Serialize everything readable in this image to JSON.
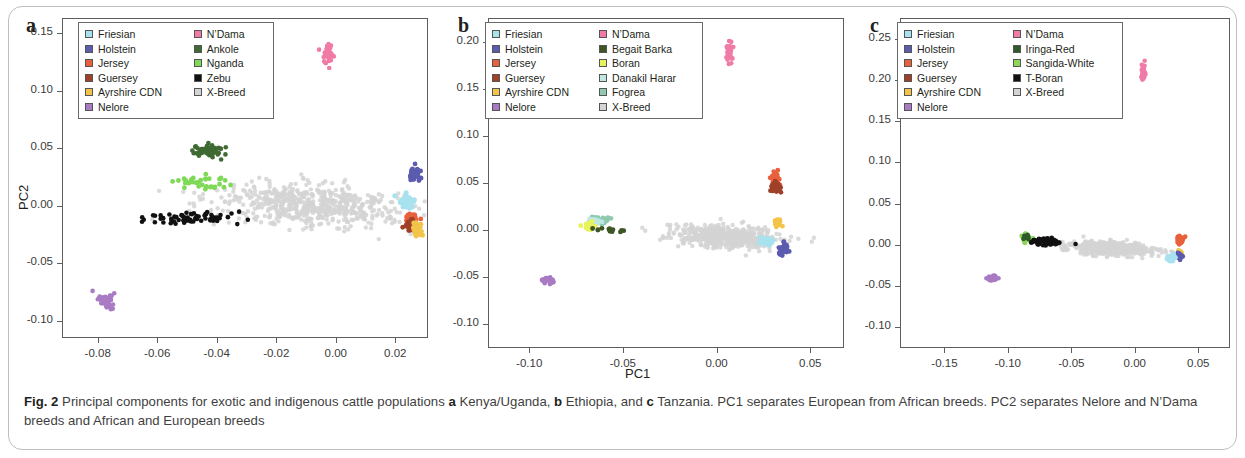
{
  "figure": {
    "caption_label": "Fig. 2",
    "caption_part1": " Principal components for exotic and indigenous cattle populations ",
    "caption_a": "a",
    "caption_part2": " Kenya/Uganda, ",
    "caption_b": "b",
    "caption_part3": " Ethiopia, and ",
    "caption_c": "c",
    "caption_part4": " Tanzania. PC1 separates European from African breeds. PC2 separates Nelore and N’Dama breeds and African and European breeds"
  },
  "axis_titles": {
    "y": "PC2",
    "x": "PC1"
  },
  "colors": {
    "friesian": "#a8e2ef",
    "holstein": "#5b5bb0",
    "jersey": "#e8613c",
    "guersey": "#9e4128",
    "ayrshire": "#f2c44a",
    "nelore": "#a97bc4",
    "ndama": "#ef7ba6",
    "ankole": "#3f6b33",
    "nganda": "#7ed957",
    "zebu": "#111111",
    "xbreed": "#d4d4d4",
    "begait_barka": "#3d5624",
    "boran": "#e8f25a",
    "danakil_harar": "#bfe8e4",
    "fogrea": "#8fc9ae",
    "iringa_red": "#2f5a2a",
    "sangida_white": "#8ed65a",
    "tboran": "#111111",
    "axis": "#5e5e5e"
  },
  "chart_data": [
    {
      "type": "scatter",
      "panel": "a",
      "title": "Kenya/Uganda",
      "xlabel": "",
      "ylabel": "PC2",
      "xlim": [
        -0.092,
        0.031
      ],
      "ylim": [
        -0.115,
        0.163
      ],
      "xticks": [
        -0.08,
        -0.06,
        -0.04,
        -0.02,
        0.0,
        0.02
      ],
      "xticklabels": [
        "-0.08",
        "-0.06",
        "-0.04",
        "-0.02",
        "0.00",
        "0.02"
      ],
      "yticks": [
        0.15,
        0.1,
        0.05,
        0.0,
        -0.05,
        -0.1
      ],
      "yticklabels": [
        "0.15",
        "0.10",
        "0.05",
        "0.00",
        "-0.05",
        "-0.10"
      ],
      "grid": false,
      "legend_position": "top-left-inside",
      "legend": [
        {
          "label": "Friesian",
          "color_key": "friesian"
        },
        {
          "label": "Holstein",
          "color_key": "holstein"
        },
        {
          "label": "Jersey",
          "color_key": "jersey"
        },
        {
          "label": "Guersey",
          "color_key": "guersey"
        },
        {
          "label": "Ayrshire CDN",
          "color_key": "ayrshire"
        },
        {
          "label": "Nelore",
          "color_key": "nelore"
        },
        {
          "label": "N’Dama",
          "color_key": "ndama"
        },
        {
          "label": "Ankole",
          "color_key": "ankole"
        },
        {
          "label": "Nganda",
          "color_key": "nganda"
        },
        {
          "label": "Zebu",
          "color_key": "zebu"
        },
        {
          "label": "X-Breed",
          "color_key": "xbreed"
        }
      ],
      "clusters": [
        {
          "name": "X-Breed",
          "color_key": "xbreed",
          "n": 620,
          "cx": -0.008,
          "cy": 0.002,
          "sx": 0.0155,
          "sy": 0.0088,
          "rot": -0.22,
          "r": 2.2
        },
        {
          "name": "Zebu",
          "color_key": "zebu",
          "n": 70,
          "cx": -0.049,
          "cy": -0.01,
          "sx": 0.0072,
          "sy": 0.0028,
          "rot": 0.05,
          "r": 2.3
        },
        {
          "name": "Ankole",
          "color_key": "ankole",
          "n": 62,
          "cx": -0.0435,
          "cy": 0.048,
          "sx": 0.0026,
          "sy": 0.0035,
          "rot": 0.0,
          "r": 2.3
        },
        {
          "name": "Nganda",
          "color_key": "nganda",
          "n": 34,
          "cx": -0.0455,
          "cy": 0.021,
          "sx": 0.004,
          "sy": 0.0032,
          "rot": 0.0,
          "r": 2.4
        },
        {
          "name": "Nelore",
          "color_key": "nelore",
          "n": 40,
          "cx": -0.0775,
          "cy": -0.0815,
          "sx": 0.0017,
          "sy": 0.0035,
          "rot": 0.3,
          "r": 2.3
        },
        {
          "name": "N’Dama",
          "color_key": "ndama",
          "n": 38,
          "cx": -0.003,
          "cy": 0.132,
          "sx": 0.0009,
          "sy": 0.0048,
          "rot": 0.0,
          "r": 2.3
        },
        {
          "name": "Holstein",
          "color_key": "holstein",
          "n": 34,
          "cx": 0.0263,
          "cy": 0.0268,
          "sx": 0.001,
          "sy": 0.0033,
          "rot": 0.0,
          "r": 2.4
        },
        {
          "name": "Friesian",
          "color_key": "friesian",
          "n": 36,
          "cx": 0.0228,
          "cy": 0.0045,
          "sx": 0.0015,
          "sy": 0.003,
          "rot": 0.0,
          "r": 2.5
        },
        {
          "name": "Jersey",
          "color_key": "jersey",
          "n": 30,
          "cx": 0.0252,
          "cy": -0.0105,
          "sx": 0.0011,
          "sy": 0.0022,
          "rot": 0.0,
          "r": 2.4
        },
        {
          "name": "Guersey",
          "color_key": "guersey",
          "n": 30,
          "cx": 0.025,
          "cy": -0.0165,
          "sx": 0.001,
          "sy": 0.003,
          "rot": 0.0,
          "r": 2.4
        },
        {
          "name": "Ayrshire CDN",
          "color_key": "ayrshire",
          "n": 28,
          "cx": 0.0268,
          "cy": -0.0205,
          "sx": 0.001,
          "sy": 0.003,
          "rot": 0.0,
          "r": 2.4
        }
      ]
    },
    {
      "type": "scatter",
      "panel": "b",
      "title": "Ethiopia",
      "xlabel": "PC1",
      "ylabel": "",
      "xlim": [
        -0.122,
        0.068
      ],
      "ylim": [
        -0.125,
        0.225
      ],
      "xticks": [
        -0.1,
        -0.05,
        0.0,
        0.05
      ],
      "xticklabels": [
        "-0.10",
        "-0.05",
        "0.00",
        "0.05"
      ],
      "yticks": [
        0.2,
        0.15,
        0.1,
        0.05,
        0.0,
        -0.05,
        -0.1
      ],
      "yticklabels": [
        "0.20",
        "0.15",
        "0.10",
        "0.05",
        "0.00",
        "-0.05",
        "-0.10"
      ],
      "grid": false,
      "legend_position": "top-left-inside",
      "legend": [
        {
          "label": "Friesian",
          "color_key": "friesian"
        },
        {
          "label": "Holstein",
          "color_key": "holstein"
        },
        {
          "label": "Jersey",
          "color_key": "jersey"
        },
        {
          "label": "Guersey",
          "color_key": "guersey"
        },
        {
          "label": "Ayrshire CDN",
          "color_key": "ayrshire"
        },
        {
          "label": "Nelore",
          "color_key": "nelore"
        },
        {
          "label": "N’Dama",
          "color_key": "ndama"
        },
        {
          "label": "Begait Barka",
          "color_key": "begait_barka"
        },
        {
          "label": "Boran",
          "color_key": "boran"
        },
        {
          "label": "Danakil Harar",
          "color_key": "danakil_harar"
        },
        {
          "label": "Fogrea",
          "color_key": "fogrea"
        },
        {
          "label": "X-Breed",
          "color_key": "xbreed"
        }
      ],
      "clusters": [
        {
          "name": "X-Breed",
          "color_key": "xbreed",
          "n": 560,
          "cx": 0.004,
          "cy": -0.006,
          "sx": 0.0135,
          "sy": 0.0058,
          "rot": -0.16,
          "r": 2.2
        },
        {
          "name": "Nelore",
          "color_key": "nelore",
          "n": 34,
          "cx": -0.0905,
          "cy": -0.052,
          "sx": 0.002,
          "sy": 0.0022,
          "rot": 0.3,
          "r": 2.3
        },
        {
          "name": "N’Dama",
          "color_key": "ndama",
          "n": 34,
          "cx": 0.0062,
          "cy": 0.1905,
          "sx": 0.0009,
          "sy": 0.0045,
          "rot": 0.0,
          "r": 2.3
        },
        {
          "name": "Jersey",
          "color_key": "jersey",
          "n": 34,
          "cx": 0.031,
          "cy": 0.056,
          "sx": 0.0011,
          "sy": 0.004,
          "rot": 0.0,
          "r": 2.4
        },
        {
          "name": "Guersey",
          "color_key": "guersey",
          "n": 26,
          "cx": 0.0312,
          "cy": 0.0455,
          "sx": 0.001,
          "sy": 0.0028,
          "rot": 0.0,
          "r": 2.4
        },
        {
          "name": "Ayrshire CDN",
          "color_key": "ayrshire",
          "n": 26,
          "cx": 0.0322,
          "cy": 0.0095,
          "sx": 0.0009,
          "sy": 0.0028,
          "rot": 0.0,
          "r": 2.4
        },
        {
          "name": "Friesian",
          "color_key": "friesian",
          "n": 34,
          "cx": 0.0253,
          "cy": -0.0105,
          "sx": 0.0017,
          "sy": 0.0022,
          "rot": 0.0,
          "r": 2.5
        },
        {
          "name": "Holstein",
          "color_key": "holstein",
          "n": 34,
          "cx": 0.0348,
          "cy": -0.0185,
          "sx": 0.0012,
          "sy": 0.003,
          "rot": 0.0,
          "r": 2.4
        },
        {
          "name": "Fogrea",
          "color_key": "fogrea",
          "n": 26,
          "cx": -0.063,
          "cy": 0.0115,
          "sx": 0.0022,
          "sy": 0.0018,
          "rot": 0.7,
          "r": 2.4
        },
        {
          "name": "Danakil Harar",
          "color_key": "danakil_harar",
          "n": 22,
          "cx": -0.0655,
          "cy": 0.0098,
          "sx": 0.002,
          "sy": 0.0016,
          "rot": 0.7,
          "r": 2.4
        },
        {
          "name": "Boran",
          "color_key": "boran",
          "n": 22,
          "cx": -0.0685,
          "cy": 0.006,
          "sx": 0.0019,
          "sy": 0.0015,
          "rot": 0.7,
          "r": 2.4
        },
        {
          "name": "Begait Barka",
          "color_key": "begait_barka",
          "n": 12,
          "cx": -0.0605,
          "cy": 0.0015,
          "sx": 0.0055,
          "sy": 0.0012,
          "rot": 0.0,
          "r": 2.4
        }
      ]
    },
    {
      "type": "scatter",
      "panel": "c",
      "title": "Tanzania",
      "xlabel": "",
      "ylabel": "",
      "xlim": [
        -0.185,
        0.075
      ],
      "ylim": [
        -0.125,
        0.275
      ],
      "xticks": [
        -0.15,
        -0.1,
        -0.05,
        0.0,
        0.05
      ],
      "xticklabels": [
        "-0.15",
        "-0.10",
        "-0.05",
        "0.00",
        "0.05"
      ],
      "yticks": [
        0.25,
        0.2,
        0.15,
        0.1,
        0.05,
        0.0,
        -0.05,
        -0.1
      ],
      "yticklabels": [
        "0.25",
        "0.20",
        "0.15",
        "0.10",
        "0.05",
        "0.00",
        "-0.05",
        "-0.10"
      ],
      "grid": false,
      "legend_position": "top-left-inside",
      "legend": [
        {
          "label": "Friesian",
          "color_key": "friesian"
        },
        {
          "label": "Holstein",
          "color_key": "holstein"
        },
        {
          "label": "Jersey",
          "color_key": "jersey"
        },
        {
          "label": "Guersey",
          "color_key": "guersey"
        },
        {
          "label": "Ayrshire CDN",
          "color_key": "ayrshire"
        },
        {
          "label": "Nelore",
          "color_key": "nelore"
        },
        {
          "label": "N’Dama",
          "color_key": "ndama"
        },
        {
          "label": "Iringa-Red",
          "color_key": "iringa_red"
        },
        {
          "label": "Sangida-White",
          "color_key": "sangida_white"
        },
        {
          "label": "T-Boran",
          "color_key": "tboran"
        },
        {
          "label": "X-Breed",
          "color_key": "xbreed"
        }
      ],
      "clusters": [
        {
          "name": "X-Breed",
          "color_key": "xbreed",
          "n": 460,
          "cx": -0.02,
          "cy": -0.003,
          "sx": 0.0165,
          "sy": 0.004,
          "rot": -0.1,
          "r": 2.2
        },
        {
          "name": "Nelore",
          "color_key": "nelore",
          "n": 30,
          "cx": -0.113,
          "cy": -0.0395,
          "sx": 0.0028,
          "sy": 0.0018,
          "rot": 0.35,
          "r": 2.3
        },
        {
          "name": "N’Dama",
          "color_key": "ndama",
          "n": 30,
          "cx": 0.006,
          "cy": 0.21,
          "sx": 0.0009,
          "sy": 0.0045,
          "rot": 0.0,
          "r": 2.3
        },
        {
          "name": "Sangida-White",
          "color_key": "sangida_white",
          "n": 34,
          "cx": -0.0855,
          "cy": 0.0085,
          "sx": 0.0026,
          "sy": 0.0022,
          "rot": 0.0,
          "r": 2.4
        },
        {
          "name": "Iringa-Red",
          "color_key": "iringa_red",
          "n": 10,
          "cx": -0.0845,
          "cy": 0.011,
          "sx": 0.0018,
          "sy": 0.0016,
          "rot": 0.0,
          "r": 2.4
        },
        {
          "name": "T-Boran",
          "color_key": "tboran",
          "n": 70,
          "cx": -0.07,
          "cy": 0.0048,
          "sx": 0.0075,
          "sy": 0.0022,
          "rot": 0.0,
          "r": 2.3
        },
        {
          "name": "Jersey",
          "color_key": "jersey",
          "n": 30,
          "cx": 0.0348,
          "cy": 0.0075,
          "sx": 0.0011,
          "sy": 0.0024,
          "rot": 0.0,
          "r": 2.4
        },
        {
          "name": "Ayrshire CDN",
          "color_key": "ayrshire",
          "n": 20,
          "cx": 0.0348,
          "cy": -0.0095,
          "sx": 0.0009,
          "sy": 0.0018,
          "rot": 0.0,
          "r": 2.4
        },
        {
          "name": "Holstein",
          "color_key": "holstein",
          "n": 30,
          "cx": 0.0345,
          "cy": -0.0125,
          "sx": 0.0011,
          "sy": 0.0022,
          "rot": 0.0,
          "r": 2.4
        },
        {
          "name": "Friesian",
          "color_key": "friesian",
          "n": 26,
          "cx": 0.0282,
          "cy": -0.0148,
          "sx": 0.0014,
          "sy": 0.002,
          "rot": 0.0,
          "r": 2.5
        }
      ]
    }
  ]
}
